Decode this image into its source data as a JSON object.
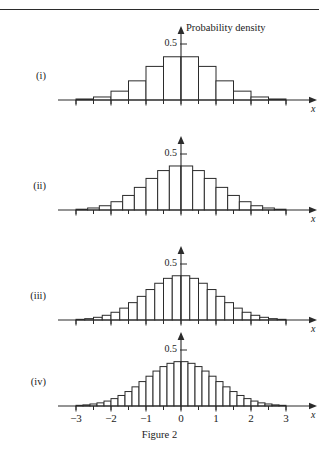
{
  "figure": {
    "caption": "Figure 2",
    "ghost_header": "",
    "y_axis_label": "Probability density",
    "y_tick_label": "0.5",
    "x_axis_symbol": "x"
  },
  "axis": {
    "x_min": -3.4,
    "x_max": 3.4,
    "x_tick_values": [
      -3,
      -2,
      -1,
      0,
      1,
      2,
      3
    ],
    "x_tick_labels": [
      "−3",
      "−2",
      "−1",
      "0",
      "1",
      "2",
      "3"
    ],
    "x_minor_step": 0.5,
    "y_min": 0,
    "y_max": 0.58,
    "y_tick_values": [
      0.5
    ]
  },
  "panels": [
    {
      "label": "(i)",
      "bin_width": 0.5,
      "show_x_tick_labels": false,
      "show_y_axis_title": true
    },
    {
      "label": "(ii)",
      "bin_width": 0.3333,
      "show_x_tick_labels": false,
      "show_y_axis_title": false
    },
    {
      "label": "(iii)",
      "bin_width": 0.25,
      "show_x_tick_labels": false,
      "show_y_axis_title": false
    },
    {
      "label": "(iv)",
      "bin_width": 0.2,
      "show_x_tick_labels": true,
      "show_y_axis_title": false
    }
  ],
  "chart_data": {
    "type": "bar",
    "title": "Figure 2",
    "xlabel": "x",
    "ylabel": "Probability density",
    "xlim": [
      -3.4,
      3.4
    ],
    "ylim": [
      0,
      0.58
    ],
    "grid": false,
    "legend": null,
    "subplots": [
      {
        "name": "(i)",
        "bin_width": 0.5,
        "bin_edges": [
          -3.0,
          -2.5,
          -2.0,
          -1.5,
          -1.0,
          -0.5,
          0.0,
          0.5,
          1.0,
          1.5,
          2.0,
          2.5,
          3.0
        ],
        "bin_centers": [
          -2.75,
          -2.25,
          -1.75,
          -1.25,
          -0.75,
          -0.25,
          0.25,
          0.75,
          1.25,
          1.75,
          2.25,
          2.75
        ],
        "values": [
          0.009,
          0.027,
          0.079,
          0.171,
          0.3,
          0.386,
          0.386,
          0.3,
          0.171,
          0.079,
          0.027,
          0.009
        ]
      },
      {
        "name": "(ii)",
        "bin_width": 0.3333,
        "bin_edges": [
          -3.0,
          -2.667,
          -2.333,
          -2.0,
          -1.667,
          -1.333,
          -1.0,
          -0.667,
          -0.333,
          0.0,
          0.333,
          0.667,
          1.0,
          1.333,
          1.667,
          2.0,
          2.333,
          2.667,
          3.0
        ],
        "bin_centers": [
          -2.833,
          -2.5,
          -2.167,
          -1.833,
          -1.5,
          -1.167,
          -0.833,
          -0.5,
          -0.167,
          0.167,
          0.5,
          0.833,
          1.167,
          1.5,
          1.833,
          2.167,
          2.5,
          2.833
        ],
        "values": [
          0.007,
          0.018,
          0.038,
          0.074,
          0.13,
          0.202,
          0.282,
          0.352,
          0.393,
          0.393,
          0.352,
          0.282,
          0.202,
          0.13,
          0.074,
          0.038,
          0.018,
          0.007
        ]
      },
      {
        "name": "(iii)",
        "bin_width": 0.25,
        "bin_edges": [
          -3.0,
          -2.75,
          -2.5,
          -2.25,
          -2.0,
          -1.75,
          -1.5,
          -1.25,
          -1.0,
          -0.75,
          -0.5,
          -0.25,
          0.0,
          0.25,
          0.5,
          0.75,
          1.0,
          1.25,
          1.5,
          1.75,
          2.0,
          2.25,
          2.5,
          2.75,
          3.0
        ],
        "bin_centers": [
          -2.875,
          -2.625,
          -2.375,
          -2.125,
          -1.875,
          -1.625,
          -1.375,
          -1.125,
          -0.875,
          -0.625,
          -0.375,
          -0.125,
          0.125,
          0.375,
          0.625,
          0.875,
          1.125,
          1.375,
          1.625,
          1.875,
          2.125,
          2.375,
          2.625,
          2.875
        ],
        "values": [
          0.006,
          0.012,
          0.024,
          0.042,
          0.069,
          0.106,
          0.155,
          0.211,
          0.272,
          0.328,
          0.372,
          0.395,
          0.395,
          0.372,
          0.328,
          0.272,
          0.211,
          0.155,
          0.106,
          0.069,
          0.042,
          0.024,
          0.012,
          0.006
        ]
      },
      {
        "name": "(iv)",
        "bin_width": 0.2,
        "bin_edges": [
          -3.0,
          -2.8,
          -2.6,
          -2.4,
          -2.2,
          -2.0,
          -1.8,
          -1.6,
          -1.4,
          -1.2,
          -1.0,
          -0.8,
          -0.6,
          -0.4,
          -0.2,
          0.0,
          0.2,
          0.4,
          0.6,
          0.8,
          1.0,
          1.2,
          1.4,
          1.6,
          1.8,
          2.0,
          2.2,
          2.4,
          2.6,
          2.8,
          3.0
        ],
        "bin_centers": [
          -2.9,
          -2.7,
          -2.5,
          -2.3,
          -2.1,
          -1.9,
          -1.7,
          -1.5,
          -1.3,
          -1.1,
          -0.9,
          -0.7,
          -0.5,
          -0.3,
          -0.1,
          0.1,
          0.3,
          0.5,
          0.7,
          0.9,
          1.1,
          1.3,
          1.5,
          1.7,
          1.9,
          2.1,
          2.3,
          2.5,
          2.7,
          2.9
        ],
        "values": [
          0.006,
          0.01,
          0.018,
          0.028,
          0.044,
          0.066,
          0.094,
          0.129,
          0.171,
          0.218,
          0.266,
          0.312,
          0.352,
          0.381,
          0.396,
          0.396,
          0.381,
          0.352,
          0.312,
          0.266,
          0.218,
          0.171,
          0.129,
          0.094,
          0.066,
          0.044,
          0.028,
          0.018,
          0.01,
          0.006
        ]
      }
    ]
  }
}
